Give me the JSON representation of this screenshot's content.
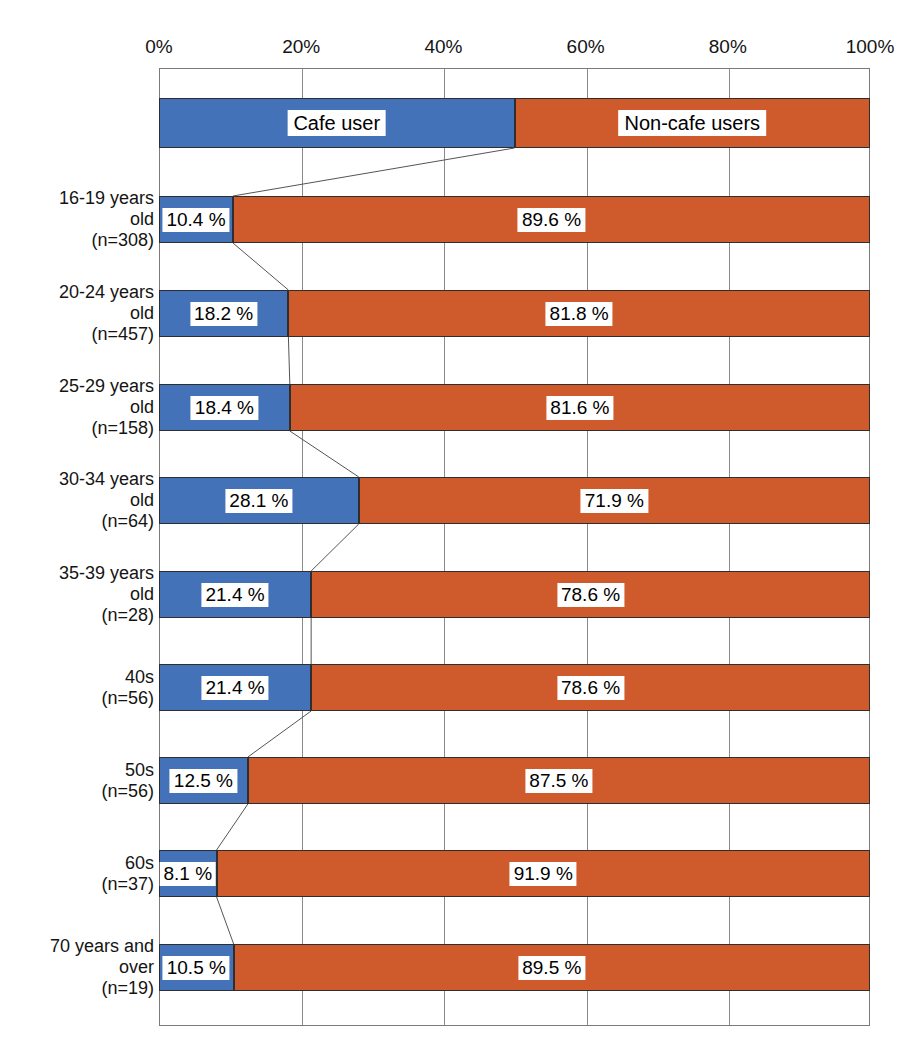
{
  "chart_data": {
    "type": "bar",
    "subtype": "100% stacked horizontal bar",
    "title": "",
    "xlabel": "",
    "ylabel": "",
    "xlim": [
      0,
      100
    ],
    "xticks": [
      "0%",
      "20%",
      "40%",
      "60%",
      "80%",
      "100%"
    ],
    "xtick_values": [
      0,
      20,
      40,
      60,
      80,
      100
    ],
    "grid": true,
    "legend_position": "top bar",
    "series": [
      {
        "name": "Cafe user",
        "color": "#4472b8"
      },
      {
        "name": "Non-cafe users",
        "color": "#cf5a2b"
      }
    ],
    "legend_bar": {
      "labels": [
        "Cafe user",
        "Non-cafe users"
      ],
      "values": [
        50,
        50
      ]
    },
    "categories": [
      "16-19 years old (n=308)",
      "20-24 years old (n=457)",
      "25-29 years old (n=158)",
      "30-34 years old (n=64)",
      "35-39 years old (n=28)",
      "40s (n=56)",
      "50s (n=56)",
      "60s (n=37)",
      "70 years and over (n=19)"
    ],
    "category_lines": [
      [
        "16-19 years",
        "old",
        "(n=308)"
      ],
      [
        "20-24 years",
        "old",
        "(n=457)"
      ],
      [
        "25-29 years",
        "old",
        "(n=158)"
      ],
      [
        "30-34 years",
        "old",
        "(n=64)"
      ],
      [
        "35-39 years",
        "old",
        "(n=28)"
      ],
      [
        "40s",
        "(n=56)"
      ],
      [
        "50s",
        "(n=56)"
      ],
      [
        "60s",
        "(n=37)"
      ],
      [
        "70 years and",
        "over",
        "(n=19)"
      ]
    ],
    "sample_sizes": [
      308,
      457,
      158,
      64,
      28,
      56,
      56,
      37,
      19
    ],
    "values": {
      "Cafe user": [
        10.4,
        18.2,
        18.4,
        28.1,
        21.4,
        21.4,
        12.5,
        8.1,
        10.5
      ],
      "Non-cafe users": [
        89.6,
        81.8,
        81.6,
        71.9,
        78.6,
        78.6,
        87.5,
        91.9,
        89.5
      ]
    },
    "value_labels": {
      "Cafe user": [
        "10.4 %",
        "18.2 %",
        "18.4 %",
        "28.1 %",
        "21.4 %",
        "21.4 %",
        "12.5 %",
        "8.1 %",
        "10.5 %"
      ],
      "Non-cafe users": [
        "89.6 %",
        "81.8 %",
        "81.6 %",
        "71.9 %",
        "78.6 %",
        "78.6 %",
        "87.5 %",
        "91.9 %",
        "89.5 %"
      ]
    }
  },
  "colors": {
    "cafe_user": "#4472b8",
    "non_cafe_users": "#cf5a2b",
    "grid": "#8a8a8a",
    "bar_border": "#2e2e2e",
    "connector": "#555555",
    "text": "#141414"
  }
}
